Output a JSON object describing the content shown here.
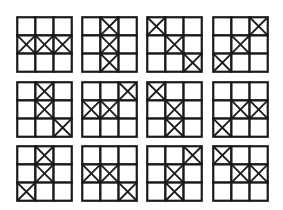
{
  "grid_size": 3,
  "mark_symbol": "X",
  "colors": {
    "line": "#1a1a1a",
    "background": "#ffffff"
  },
  "boards": [
    {
      "id": 1,
      "marks": [
        [
          1,
          0
        ],
        [
          1,
          1
        ],
        [
          1,
          2
        ]
      ]
    },
    {
      "id": 2,
      "marks": [
        [
          0,
          1
        ],
        [
          1,
          1
        ],
        [
          2,
          1
        ]
      ]
    },
    {
      "id": 3,
      "marks": [
        [
          0,
          0
        ],
        [
          1,
          1
        ],
        [
          2,
          2
        ]
      ]
    },
    {
      "id": 4,
      "marks": [
        [
          0,
          2
        ],
        [
          1,
          1
        ],
        [
          2,
          0
        ]
      ]
    },
    {
      "id": 5,
      "marks": [
        [
          0,
          1
        ],
        [
          1,
          1
        ],
        [
          2,
          2
        ]
      ]
    },
    {
      "id": 6,
      "marks": [
        [
          0,
          2
        ],
        [
          1,
          0
        ],
        [
          1,
          1
        ]
      ]
    },
    {
      "id": 7,
      "marks": [
        [
          0,
          0
        ],
        [
          1,
          1
        ],
        [
          2,
          1
        ]
      ]
    },
    {
      "id": 8,
      "marks": [
        [
          1,
          1
        ],
        [
          1,
          2
        ],
        [
          2,
          0
        ]
      ]
    },
    {
      "id": 9,
      "marks": [
        [
          0,
          1
        ],
        [
          1,
          1
        ],
        [
          2,
          0
        ]
      ]
    },
    {
      "id": 10,
      "marks": [
        [
          1,
          0
        ],
        [
          1,
          1
        ],
        [
          2,
          2
        ]
      ]
    },
    {
      "id": 11,
      "marks": [
        [
          0,
          2
        ],
        [
          1,
          1
        ],
        [
          2,
          1
        ]
      ]
    },
    {
      "id": 12,
      "marks": [
        [
          0,
          0
        ],
        [
          1,
          1
        ],
        [
          1,
          2
        ]
      ]
    }
  ]
}
